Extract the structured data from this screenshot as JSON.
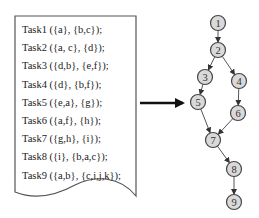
{
  "document": {
    "tasks": [
      "Task1 ({a}, {b,c});",
      "Task2 ({a, c}, {d});",
      "Task3 ({d,b}, {e,f});",
      "Task4 ({d}, {b,f});",
      "Task5 ({e,a}, {g});",
      "Task6 ({a,f}, {h});",
      "Task7 ({g,h}, {i});",
      "Task8 ({i}, {b,a,c});",
      "Task9 ({a,b}, {c,i,j,k});"
    ]
  },
  "arrow": {
    "label": ""
  },
  "graph": {
    "nodes": [
      {
        "id": "1",
        "x": 218,
        "y": 23
      },
      {
        "id": "2",
        "x": 218,
        "y": 50
      },
      {
        "id": "3",
        "x": 205,
        "y": 77
      },
      {
        "id": "4",
        "x": 239,
        "y": 81
      },
      {
        "id": "5",
        "x": 198,
        "y": 102
      },
      {
        "id": "6",
        "x": 238,
        "y": 113
      },
      {
        "id": "7",
        "x": 213,
        "y": 140
      },
      {
        "id": "8",
        "x": 234,
        "y": 169
      },
      {
        "id": "9",
        "x": 234,
        "y": 202
      }
    ],
    "edges": [
      [
        "1",
        "2"
      ],
      [
        "2",
        "3"
      ],
      [
        "2",
        "4"
      ],
      [
        "3",
        "5"
      ],
      [
        "4",
        "6"
      ],
      [
        "5",
        "7"
      ],
      [
        "6",
        "7"
      ],
      [
        "7",
        "8"
      ],
      [
        "8",
        "9"
      ]
    ]
  }
}
